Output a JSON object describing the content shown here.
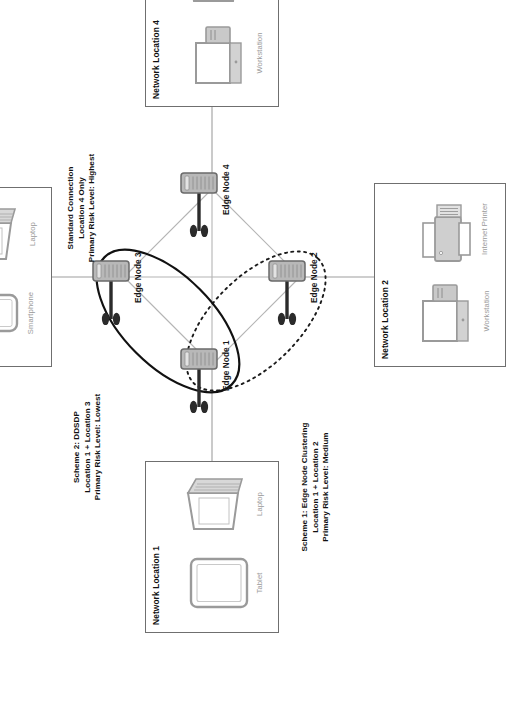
{
  "diagram": {
    "colors": {
      "box_border": "#6f6f6f",
      "device_label": "#9a9a9a",
      "node_body": "#b8b8b8",
      "node_stroke": "#6a6a6a",
      "antenna": "#2b2b2b",
      "mesh_line": "#b4b4b4",
      "link_line": "#9e9e9e",
      "scheme1_ellipse": "#1a1a1a",
      "scheme2_ellipse": "#111111",
      "text": "#111111"
    },
    "locations": [
      {
        "id": "location-1",
        "title": "Network Location 1",
        "devices": [
          {
            "label": "Tablet",
            "icon": "tablet-icon"
          },
          {
            "label": "Laptop",
            "icon": "laptop-icon"
          }
        ]
      },
      {
        "id": "location-2",
        "title": "Network Location 2",
        "devices": [
          {
            "label": "Workstation",
            "icon": "workstation-icon"
          },
          {
            "label": "Internet Printer",
            "icon": "printer-icon"
          }
        ]
      },
      {
        "id": "location-3",
        "title": "Network Location 3",
        "devices": [
          {
            "label": "Smartphone",
            "icon": "smartphone-icon"
          },
          {
            "label": "Laptop",
            "icon": "laptop-icon"
          }
        ]
      },
      {
        "id": "location-4",
        "title": "Network Location 4",
        "devices": [
          {
            "label": "Workstation",
            "icon": "workstation-icon"
          },
          {
            "label": "Laptop",
            "icon": "laptop-icon"
          }
        ]
      }
    ],
    "edge_nodes": [
      {
        "id": "edge-node-1",
        "label": "Edge Node 1"
      },
      {
        "id": "edge-node-2",
        "label": "Edge Node 2"
      },
      {
        "id": "edge-node-3",
        "label": "Edge Node 3"
      },
      {
        "id": "edge-node-4",
        "label": "Edge Node 4"
      }
    ],
    "annotations": [
      {
        "id": "scheme-1",
        "line1": "Scheme 1: Edge Node Clustering",
        "line2": "Location 1 + Location 2",
        "line3": "Primary Risk Level: Medium",
        "boundary_style": "dotted",
        "covers": [
          "Edge Node 1",
          "Edge Node 2"
        ],
        "risk_level": "Medium"
      },
      {
        "id": "scheme-2",
        "line1": "Scheme 2: DDSDP",
        "line2": "Location 1 + Location 3",
        "line3": "Primary Risk Level: Lowest",
        "boundary_style": "solid",
        "covers": [
          "Edge Node 1",
          "Edge Node 3"
        ],
        "risk_level": "Lowest"
      },
      {
        "id": "standard-connection",
        "line1": "Standard Connection",
        "line2": "Location 4 Only",
        "line3": "Primary Risk Level: Highest",
        "boundary_style": "none",
        "covers": [
          "Edge Node 4"
        ],
        "risk_level": "Highest"
      }
    ]
  }
}
